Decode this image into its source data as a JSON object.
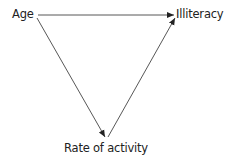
{
  "diagram": {
    "type": "causal-triangle",
    "nodes": [
      {
        "id": "age",
        "label": "Age"
      },
      {
        "id": "illiteracy",
        "label": "Illiteracy"
      },
      {
        "id": "rate",
        "label": "Rate of activity"
      }
    ],
    "edges": [
      {
        "from": "age",
        "to": "illiteracy"
      },
      {
        "from": "age",
        "to": "rate"
      },
      {
        "from": "rate",
        "to": "illiteracy"
      }
    ],
    "colors": {
      "line": "#333333",
      "text": "#222222",
      "background": "#ffffff"
    }
  }
}
